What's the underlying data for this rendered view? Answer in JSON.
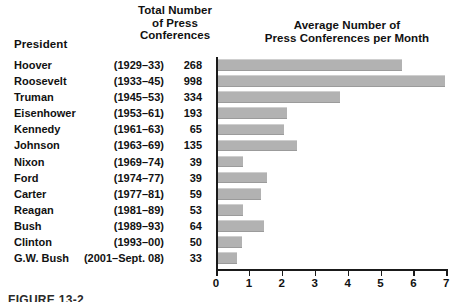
{
  "table": {
    "president_header": "President",
    "total_header_lines": [
      "Total Number",
      "of Press",
      "Conferences"
    ],
    "rows": [
      {
        "president": "Hoover",
        "years": "(1929–33)",
        "total": "268"
      },
      {
        "president": "Roosevelt",
        "years": "(1933–45)",
        "total": "998"
      },
      {
        "president": "Truman",
        "years": "(1945–53)",
        "total": "334"
      },
      {
        "president": "Eisenhower",
        "years": "(1953–61)",
        "total": "193"
      },
      {
        "president": "Kennedy",
        "years": "(1961–63)",
        "total": "65"
      },
      {
        "president": "Johnson",
        "years": "(1963–69)",
        "total": "135"
      },
      {
        "president": "Nixon",
        "years": "(1969–74)",
        "total": "39"
      },
      {
        "president": "Ford",
        "years": "(1974–77)",
        "total": "39"
      },
      {
        "president": "Carter",
        "years": "(1977–81)",
        "total": "59"
      },
      {
        "president": "Reagan",
        "years": "(1981–89)",
        "total": "53"
      },
      {
        "president": "Bush",
        "years": "(1989–93)",
        "total": "64"
      },
      {
        "president": "Clinton",
        "years": "(1993–00)",
        "total": "50"
      },
      {
        "president": "G.W. Bush",
        "years": "(2001–Sept. 08)",
        "total": "33"
      }
    ]
  },
  "caption": "FIGURE 13-2",
  "chart_data": {
    "type": "bar",
    "orientation": "horizontal",
    "title": "Average Number of\nPress Conferences per Month",
    "title_lines": [
      "Average Number of",
      "Press Conferences per Month"
    ],
    "xlabel": "",
    "ylabel": "",
    "xlim": [
      0,
      7.4
    ],
    "xticks": [
      0,
      1,
      2,
      3,
      4,
      5,
      6,
      7
    ],
    "xticklabels": [
      "0",
      "1",
      "2",
      "3",
      "4",
      "5",
      "6",
      "7"
    ],
    "grid": false,
    "legend": null,
    "bar_color": "#b2b2b2",
    "categories": [
      "Hoover",
      "Roosevelt",
      "Truman",
      "Eisenhower",
      "Kennedy",
      "Johnson",
      "Nixon",
      "Ford",
      "Carter",
      "Reagan",
      "Bush",
      "Clinton",
      "G.W. Bush"
    ],
    "values": [
      5.6,
      6.9,
      3.7,
      2.1,
      2.0,
      2.4,
      0.75,
      1.5,
      1.3,
      0.75,
      1.4,
      0.72,
      0.58
    ],
    "secondary_series": {
      "name": "Total Number of Press Conferences",
      "values": [
        268,
        998,
        334,
        193,
        65,
        135,
        39,
        39,
        59,
        53,
        64,
        50,
        33
      ]
    }
  }
}
